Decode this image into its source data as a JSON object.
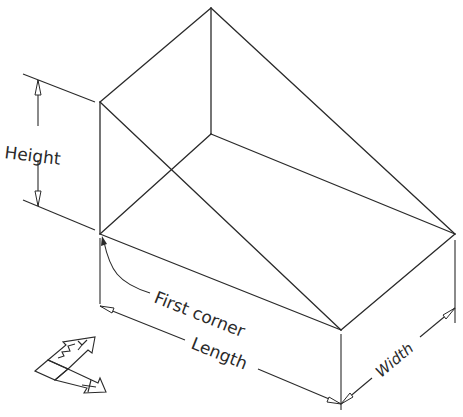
{
  "diagram": {
    "title": "",
    "type": "isometric wedge dimension drawing",
    "labels": {
      "height": "Height",
      "first_corner": "First corner",
      "length": "Length",
      "width": "Width"
    },
    "ucs_icon": {
      "x_label": "X",
      "y_label": "Y"
    },
    "colors": {
      "line": "#2a2a2a",
      "background": "#ffffff"
    }
  }
}
